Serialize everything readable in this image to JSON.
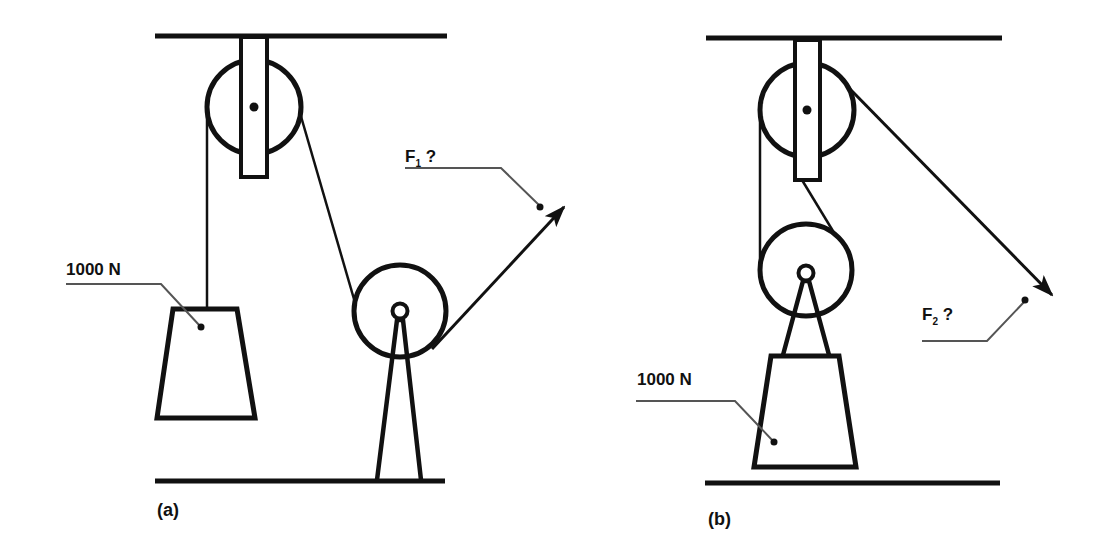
{
  "diagram": {
    "colors": {
      "ink": "#111111",
      "leader": "#555555",
      "background": "#ffffff"
    },
    "panel_a": {
      "caption": "(a)",
      "load_label": "1000 N",
      "force_label": "F",
      "force_subscript": "1",
      "force_suffix": " ?",
      "components": [
        "ceiling",
        "fixed-pulley",
        "pulley-bracket",
        "rope",
        "hanging-weight",
        "ground-pulley",
        "pulley-stand",
        "floor",
        "force-arrow"
      ]
    },
    "panel_b": {
      "caption": "(b)",
      "load_label": "1000 N",
      "force_label": "F",
      "force_subscript": "2",
      "force_suffix": " ?",
      "components": [
        "ceiling",
        "fixed-pulley",
        "pulley-bracket",
        "movable-pulley",
        "rope",
        "weight",
        "pulley-mount",
        "floor",
        "force-arrow"
      ]
    }
  }
}
